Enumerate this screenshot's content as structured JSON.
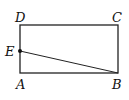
{
  "diagram": {
    "type": "geometry",
    "shape": "rectangle ABCD with segment EB",
    "points": {
      "A": {
        "label": "A",
        "x": 20,
        "y": 73
      },
      "B": {
        "label": "B",
        "x": 118,
        "y": 73
      },
      "C": {
        "label": "C",
        "x": 118,
        "y": 25
      },
      "D": {
        "label": "D",
        "x": 20,
        "y": 25
      },
      "E": {
        "label": "E",
        "x": 20,
        "y": 51
      }
    },
    "segments": [
      [
        "A",
        "B"
      ],
      [
        "B",
        "C"
      ],
      [
        "C",
        "D"
      ],
      [
        "D",
        "A"
      ],
      [
        "E",
        "B"
      ]
    ],
    "stroke_color": "#222222"
  }
}
